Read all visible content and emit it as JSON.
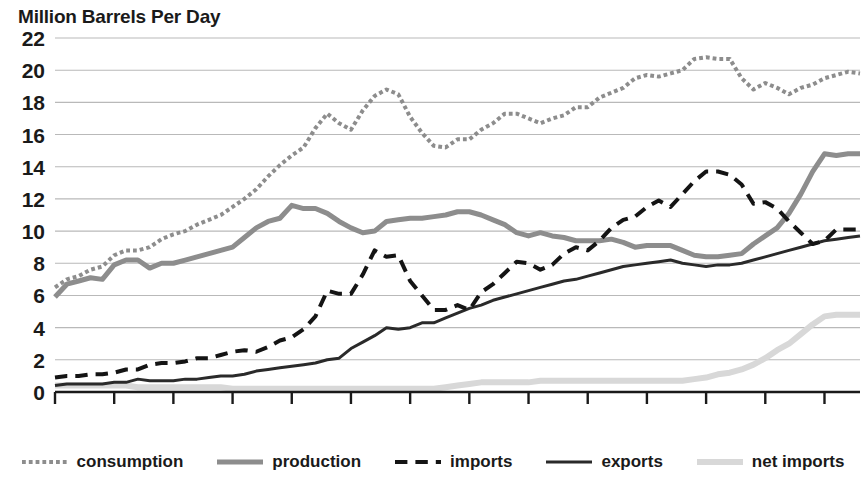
{
  "chart_data": {
    "type": "line",
    "title": "Million Barrels Per Day",
    "xlabel": "",
    "ylabel": "Million Barrels Per Day",
    "xlim": [
      1950,
      2018
    ],
    "ylim": [
      0,
      22
    ],
    "ytick_step": 2,
    "xtick_step": 5,
    "grid": "horizontal",
    "legend_position": "bottom",
    "yticks": [
      "22",
      "20",
      "18",
      "16",
      "14",
      "12",
      "10",
      "8",
      "6",
      "4",
      "2",
      "0"
    ],
    "xticks": [
      "1950",
      "1955",
      "1960",
      "1965",
      "1970",
      "1975",
      "1980",
      "1985",
      "1990",
      "1995",
      "2000",
      "2005",
      "2010",
      "2015"
    ],
    "years": [
      1950,
      1951,
      1952,
      1953,
      1954,
      1955,
      1956,
      1957,
      1958,
      1959,
      1960,
      1961,
      1962,
      1963,
      1964,
      1965,
      1966,
      1967,
      1968,
      1969,
      1970,
      1971,
      1972,
      1973,
      1974,
      1975,
      1976,
      1977,
      1978,
      1979,
      1980,
      1981,
      1982,
      1983,
      1984,
      1985,
      1986,
      1987,
      1988,
      1989,
      1990,
      1991,
      1992,
      1993,
      1994,
      1995,
      1996,
      1997,
      1998,
      1999,
      2000,
      2001,
      2002,
      2003,
      2004,
      2005,
      2006,
      2007,
      2008,
      2009,
      2010,
      2011,
      2012,
      2013,
      2014,
      2015,
      2016,
      2017,
      2018
    ],
    "series": [
      {
        "name": "consumption",
        "color": "#8d8d8d",
        "style": "dotted",
        "width": 4,
        "values": [
          6.5,
          7.0,
          7.2,
          7.6,
          7.8,
          8.5,
          8.8,
          8.8,
          9.0,
          9.5,
          9.8,
          10.0,
          10.4,
          10.7,
          11.0,
          11.5,
          12.0,
          12.6,
          13.4,
          14.1,
          14.7,
          15.2,
          16.4,
          17.3,
          16.7,
          16.3,
          17.5,
          18.4,
          18.8,
          18.5,
          17.1,
          16.1,
          15.3,
          15.2,
          15.7,
          15.7,
          16.3,
          16.7,
          17.3,
          17.3,
          17.0,
          16.7,
          17.0,
          17.2,
          17.7,
          17.7,
          18.3,
          18.6,
          18.9,
          19.5,
          19.7,
          19.6,
          19.8,
          20.0,
          20.7,
          20.8,
          20.7,
          20.7,
          19.5,
          18.8,
          19.2,
          18.9,
          18.5,
          18.9,
          19.1,
          19.5,
          19.7,
          19.9,
          19.8
        ]
      },
      {
        "name": "production",
        "color": "#8d8d8d",
        "style": "solid",
        "width": 5,
        "values": [
          5.9,
          6.7,
          6.9,
          7.1,
          7.0,
          7.9,
          8.2,
          8.2,
          7.7,
          8.0,
          8.0,
          8.2,
          8.4,
          8.6,
          8.8,
          9.0,
          9.6,
          10.2,
          10.6,
          10.8,
          11.6,
          11.4,
          11.4,
          11.1,
          10.6,
          10.2,
          9.9,
          10.0,
          10.6,
          10.7,
          10.8,
          10.8,
          10.9,
          11.0,
          11.2,
          11.2,
          11.0,
          10.7,
          10.4,
          9.9,
          9.7,
          9.9,
          9.7,
          9.6,
          9.4,
          9.4,
          9.4,
          9.5,
          9.3,
          9.0,
          9.1,
          9.1,
          9.1,
          8.8,
          8.5,
          8.4,
          8.4,
          8.5,
          8.6,
          9.2,
          9.7,
          10.2,
          11.1,
          12.3,
          13.7,
          14.8,
          14.7,
          14.8,
          14.8
        ]
      },
      {
        "name": "imports",
        "color": "#141414",
        "style": "dashed",
        "width": 4,
        "values": [
          0.9,
          1.0,
          1.0,
          1.1,
          1.1,
          1.2,
          1.4,
          1.4,
          1.7,
          1.8,
          1.8,
          1.9,
          2.1,
          2.1,
          2.3,
          2.5,
          2.6,
          2.5,
          2.8,
          3.2,
          3.4,
          3.9,
          4.7,
          6.3,
          6.1,
          6.1,
          7.3,
          8.8,
          8.4,
          8.5,
          6.9,
          6.0,
          5.1,
          5.1,
          5.4,
          5.1,
          6.2,
          6.7,
          7.4,
          8.1,
          8.0,
          7.6,
          7.9,
          8.6,
          9.0,
          8.8,
          9.4,
          10.2,
          10.7,
          10.9,
          11.5,
          11.9,
          11.5,
          12.3,
          13.1,
          13.7,
          13.7,
          13.5,
          12.9,
          11.7,
          11.8,
          11.4,
          10.6,
          9.9,
          9.2,
          9.4,
          10.1,
          10.1,
          10.1
        ]
      },
      {
        "name": "exports",
        "color": "#2a2a2a",
        "style": "solid",
        "width": 3,
        "values": [
          0.4,
          0.5,
          0.5,
          0.5,
          0.5,
          0.6,
          0.6,
          0.8,
          0.7,
          0.7,
          0.7,
          0.8,
          0.8,
          0.9,
          1.0,
          1.0,
          1.1,
          1.3,
          1.4,
          1.5,
          1.6,
          1.7,
          1.8,
          2.0,
          2.1,
          2.7,
          3.1,
          3.5,
          4.0,
          3.9,
          4.0,
          4.3,
          4.3,
          4.6,
          4.9,
          5.2,
          5.4,
          5.7,
          5.9,
          6.1,
          6.3,
          6.5,
          6.7,
          6.9,
          7.0,
          7.2,
          7.4,
          7.6,
          7.8,
          7.9,
          8.0,
          8.1,
          8.2,
          8.0,
          7.9,
          7.8,
          7.9,
          7.9,
          8.0,
          8.2,
          8.4,
          8.6,
          8.8,
          9.0,
          9.2,
          9.4,
          9.5,
          9.6,
          9.7
        ]
      },
      {
        "name": "net imports",
        "color": "#d8d8d8",
        "style": "solid",
        "width": 6,
        "values": [
          0.4,
          0.4,
          0.4,
          0.4,
          0.4,
          0.4,
          0.4,
          0.3,
          0.3,
          0.3,
          0.3,
          0.3,
          0.3,
          0.3,
          0.3,
          0.2,
          0.2,
          0.2,
          0.2,
          0.2,
          0.2,
          0.2,
          0.2,
          0.2,
          0.2,
          0.2,
          0.2,
          0.2,
          0.2,
          0.2,
          0.2,
          0.2,
          0.2,
          0.3,
          0.4,
          0.5,
          0.6,
          0.6,
          0.6,
          0.6,
          0.6,
          0.7,
          0.7,
          0.7,
          0.7,
          0.7,
          0.7,
          0.7,
          0.7,
          0.7,
          0.7,
          0.7,
          0.7,
          0.7,
          0.8,
          0.9,
          1.1,
          1.2,
          1.4,
          1.7,
          2.1,
          2.6,
          3.0,
          3.6,
          4.2,
          4.7,
          4.8,
          4.8,
          4.8
        ]
      }
    ]
  },
  "legend": {
    "items": [
      {
        "label": "consumption",
        "marker": "dotted-line-swatch"
      },
      {
        "label": "production",
        "marker": "solid-gray-line-swatch"
      },
      {
        "label": "imports",
        "marker": "dashed-line-swatch"
      },
      {
        "label": "exports",
        "marker": "solid-dark-line-swatch"
      },
      {
        "label": "net imports",
        "marker": "solid-light-line-swatch"
      }
    ]
  },
  "colors": {
    "consumption": "#8d8d8d",
    "production": "#8d8d8d",
    "imports": "#141414",
    "exports": "#2a2a2a",
    "net_imports": "#d8d8d8",
    "grid": "#b9b9b9",
    "axis": "#1a1a1a",
    "text": "#1a1a1a",
    "background": "#ffffff"
  }
}
